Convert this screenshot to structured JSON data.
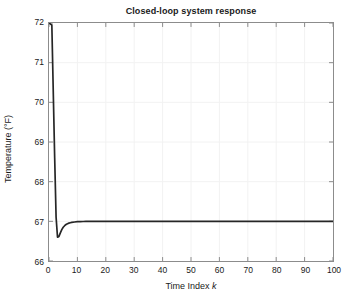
{
  "chart_data": {
    "type": "line",
    "title": "Closed-loop system response",
    "xlabel_prefix": "Time Index ",
    "xlabel_italic": "k",
    "xlabel": "Time Index k",
    "ylabel": "Temperature (°F)",
    "xlim": [
      0,
      100
    ],
    "ylim": [
      66,
      72
    ],
    "xticks": [
      0,
      10,
      20,
      30,
      40,
      50,
      60,
      70,
      80,
      90,
      100
    ],
    "yticks": [
      66,
      67,
      68,
      69,
      70,
      71,
      72
    ],
    "grid": true,
    "legend": null,
    "line_color": "#262626",
    "line_width": 1.6,
    "series": [
      {
        "name": "Closed-loop temperature response",
        "x": [
          0,
          1,
          2,
          2.5,
          3,
          3.5,
          4,
          4.5,
          5,
          5.5,
          6,
          6.5,
          7,
          7.5,
          8,
          9,
          10,
          11,
          12,
          13,
          14,
          15,
          16,
          18,
          20,
          25,
          30,
          35,
          40,
          45,
          50,
          55,
          60,
          65,
          70,
          75,
          80,
          85,
          90,
          95,
          100
        ],
        "y": [
          72.0,
          71.95,
          68.6,
          67.1,
          66.6,
          66.62,
          66.71,
          66.79,
          66.85,
          66.89,
          66.92,
          66.94,
          66.955,
          66.965,
          66.973,
          66.984,
          66.991,
          66.994,
          66.996,
          66.997,
          66.998,
          66.999,
          66.999,
          67.0,
          67.0,
          67.0,
          67.0,
          67.0,
          67.0,
          67.0,
          67.0,
          67.0,
          67.0,
          67.0,
          67.0,
          67.0,
          67.0,
          67.0,
          67.0,
          67.0,
          67.0
        ],
        "initial_value": 72.0,
        "undershoot_min": 66.6,
        "undershoot_at_k": 3,
        "steady_state": 67.0,
        "settling_k": 10
      }
    ]
  },
  "figure": {
    "background": "#ffffff",
    "axes_border_color": "#8c8c8c",
    "grid_color": "#f2f2f2",
    "tick_color": "#8c8c8c",
    "text_color": "#1a1a1a"
  },
  "bottom_sliver": {
    "text": ""
  }
}
